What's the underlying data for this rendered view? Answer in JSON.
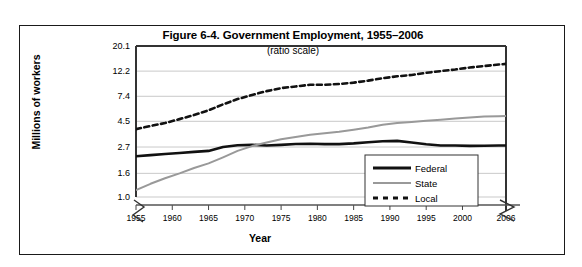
{
  "figure": {
    "title": "Figure 6-4. Government Employment, 1955–2006",
    "subtitle": "(ratio scale)"
  },
  "axes": {
    "ylabel": "Millions of workers",
    "xlabel": "Year"
  },
  "chart_data": {
    "type": "line",
    "title": "Figure 6-4. Government Employment, 1955–2006",
    "subtitle": "(ratio scale)",
    "xlabel": "Year",
    "ylabel": "Millions of workers",
    "scale": "log",
    "grid": true,
    "legend_position": "bottom-right",
    "axis_break_x": true,
    "axis_break_y": true,
    "xlim": [
      1955,
      2006
    ],
    "ylim": [
      1.0,
      20.1
    ],
    "ytick_labels": [
      "20.1",
      "12.2",
      "7.4",
      "4.5",
      "2.7",
      "1.6",
      "1.0"
    ],
    "ytick_values": [
      20.1,
      12.2,
      7.4,
      4.5,
      2.7,
      1.6,
      1.0
    ],
    "xtick_labels": [
      "1955",
      "1960",
      "1965",
      "1970",
      "1975",
      "1980",
      "1985",
      "1990",
      "1995",
      "2000",
      "2006"
    ],
    "xtick_values": [
      1955,
      1960,
      1965,
      1970,
      1975,
      1980,
      1985,
      1990,
      1995,
      2000,
      2006
    ],
    "x": [
      1955,
      1957,
      1959,
      1961,
      1963,
      1965,
      1967,
      1969,
      1971,
      1973,
      1975,
      1977,
      1979,
      1981,
      1983,
      1985,
      1987,
      1989,
      1991,
      1993,
      1995,
      1997,
      1999,
      2001,
      2003,
      2005,
      2006
    ],
    "series": [
      {
        "name": "Federal",
        "style": "solid-thick",
        "color": "#111111",
        "values": [
          2.25,
          2.3,
          2.35,
          2.4,
          2.45,
          2.5,
          2.7,
          2.8,
          2.82,
          2.78,
          2.82,
          2.87,
          2.88,
          2.86,
          2.86,
          2.9,
          2.97,
          3.03,
          3.05,
          2.95,
          2.85,
          2.78,
          2.78,
          2.76,
          2.77,
          2.78,
          2.78
        ]
      },
      {
        "name": "State",
        "style": "solid",
        "color": "#999999",
        "values": [
          1.15,
          1.3,
          1.45,
          1.6,
          1.78,
          1.95,
          2.2,
          2.5,
          2.75,
          2.95,
          3.15,
          3.3,
          3.45,
          3.55,
          3.65,
          3.8,
          3.98,
          4.2,
          4.35,
          4.45,
          4.55,
          4.65,
          4.75,
          4.85,
          4.95,
          4.98,
          5.0
        ]
      },
      {
        "name": "Local",
        "style": "dashed",
        "color": "#111111",
        "values": [
          3.85,
          4.1,
          4.35,
          4.7,
          5.1,
          5.6,
          6.3,
          7.0,
          7.6,
          8.2,
          8.7,
          9.0,
          9.3,
          9.3,
          9.45,
          9.7,
          10.1,
          10.6,
          11.0,
          11.3,
          11.8,
          12.2,
          12.6,
          13.1,
          13.5,
          13.9,
          14.1
        ]
      }
    ]
  },
  "legend": {
    "items": [
      {
        "label": "Federal"
      },
      {
        "label": "State"
      },
      {
        "label": "Local"
      }
    ]
  }
}
